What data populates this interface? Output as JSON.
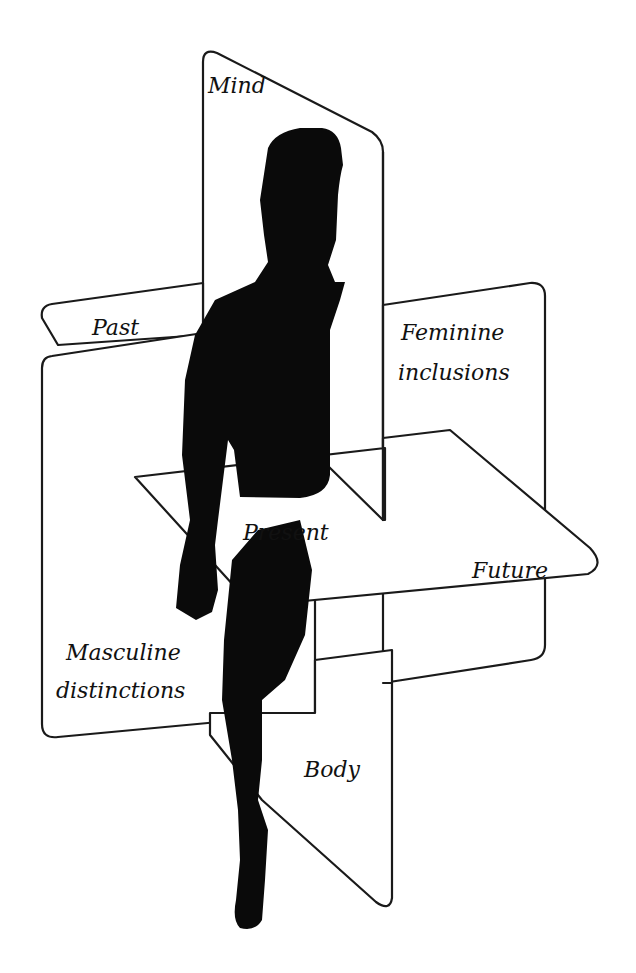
{
  "diagram": {
    "type": "three intersecting planes around a human silhouette",
    "colors": {
      "stroke": "#1a1a1a",
      "fill": "#ffffff",
      "silhouette": "#0a0a0a"
    },
    "planes": {
      "vertical_sagittal": {
        "top_label": "Mind",
        "bottom_label": "Body"
      },
      "vertical_frontal": {
        "tab_label": "Past",
        "right_label_line1": "Feminine",
        "right_label_line2": "inclusions",
        "left_label_line1": "Masculine",
        "left_label_line2": "distinctions"
      },
      "horizontal": {
        "center_label": "Present",
        "right_label": "Future"
      }
    },
    "figure": "human-silhouette"
  }
}
